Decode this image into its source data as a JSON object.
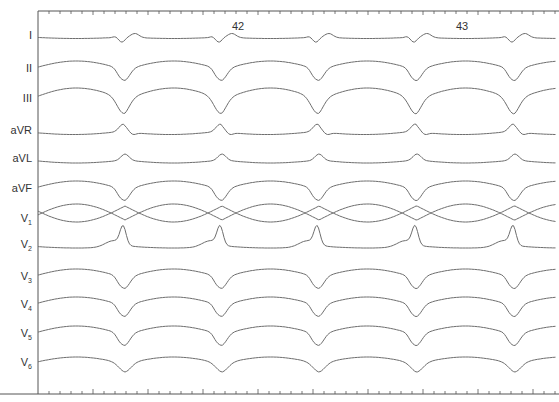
{
  "chart_data": {
    "type": "line",
    "title": "",
    "subtitle": "12-lead ECG strip",
    "xlabel": "",
    "ylabel": "",
    "grid": false,
    "legend": "none",
    "beat_markers": [
      {
        "label": "42",
        "x": 238
      },
      {
        "label": "43",
        "x": 462
      }
    ],
    "beat_positions_px": [
      125,
      222,
      319,
      417,
      515
    ],
    "leads": [
      {
        "name": "I",
        "sub": "",
        "y": 37,
        "shape": "small"
      },
      {
        "name": "II",
        "sub": "",
        "y": 70,
        "shape": "dome"
      },
      {
        "name": "III",
        "sub": "",
        "y": 100,
        "shape": "domebig"
      },
      {
        "name": "aVR",
        "sub": "",
        "y": 132,
        "shape": "inv"
      },
      {
        "name": "aVL",
        "sub": "",
        "y": 160,
        "shape": "invsmall"
      },
      {
        "name": "aVF",
        "sub": "",
        "y": 190,
        "shape": "dome"
      },
      {
        "name": "V",
        "sub": "1",
        "y": 220,
        "shape": "v1"
      },
      {
        "name": "V",
        "sub": "2",
        "y": 246,
        "shape": "v2"
      },
      {
        "name": "V",
        "sub": "3",
        "y": 278,
        "shape": "dome"
      },
      {
        "name": "V",
        "sub": "4",
        "y": 306,
        "shape": "dome"
      },
      {
        "name": "V",
        "sub": "5",
        "y": 335,
        "shape": "dome"
      },
      {
        "name": "V",
        "sub": "6",
        "y": 364,
        "shape": "domesmall"
      }
    ],
    "axes": {
      "left_x": 38,
      "top_y": 11,
      "bottom_y": 394,
      "right_x": 559,
      "tick_spacing_px": 11
    }
  },
  "labels": {
    "lead_I": "I",
    "lead_II": "II",
    "lead_III": "III",
    "lead_aVR": "aVR",
    "lead_aVL": "aVL",
    "lead_aVF": "aVF",
    "beat_42": "42",
    "beat_43": "43"
  },
  "colors": {
    "trace": "#6e6e6e",
    "axis": "#555555",
    "text": "#333333"
  }
}
